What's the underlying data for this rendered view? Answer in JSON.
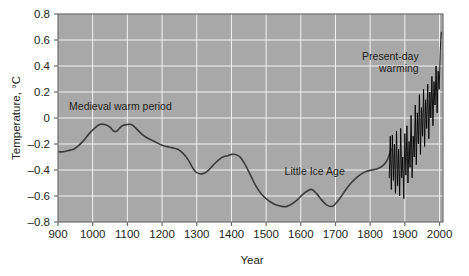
{
  "chart_data": {
    "type": "line",
    "title": "",
    "subtitle": "",
    "xlabel": "Year",
    "ylabel": "Temperature, °C",
    "xlim": [
      900,
      2010
    ],
    "ylim": [
      -0.8,
      0.8
    ],
    "xticks": [
      900,
      1000,
      1100,
      1200,
      1300,
      1400,
      1500,
      1600,
      1700,
      1800,
      1900,
      2000
    ],
    "xtick_labels": [
      "900",
      "1000",
      "1100",
      "1200",
      "1300",
      "1400",
      "1500",
      "1600",
      "1700",
      "1800",
      "1900",
      "2000"
    ],
    "yticks": [
      0.8,
      0.6,
      0.4,
      0.2,
      0,
      -0.2,
      -0.4,
      -0.6,
      -0.8
    ],
    "ytick_labels": [
      "0.8",
      "0.6",
      "0.4",
      "0.2",
      "0",
      "–0.2",
      "–0.4",
      "–0.6",
      "–0.8"
    ],
    "grid": true,
    "grid_color": "#f2f2f2",
    "plot_background": "#a8a8a8",
    "legend": [],
    "legend_position": "none",
    "annotations": [
      {
        "text": "Medieval warm period",
        "x": 1080,
        "y": 0.06,
        "anchor": "middle"
      },
      {
        "text": "Little Ice Age",
        "x": 1640,
        "y": -0.44,
        "anchor": "middle"
      },
      {
        "text": "Present-day warming",
        "lines": [
          "Present-day",
          "warming"
        ],
        "x": 1940,
        "y": 0.45,
        "anchor": "end"
      }
    ],
    "series": [
      {
        "name": "Reconstructed proxy temperature anomaly",
        "color": "#3b3b3b",
        "linewidth": 1.6,
        "x": [
          900,
          915,
          930,
          945,
          960,
          975,
          990,
          1005,
          1020,
          1035,
          1050,
          1060,
          1070,
          1085,
          1100,
          1112,
          1125,
          1140,
          1155,
          1170,
          1185,
          1200,
          1215,
          1230,
          1245,
          1260,
          1275,
          1290,
          1300,
          1315,
          1330,
          1345,
          1360,
          1375,
          1390,
          1400,
          1412,
          1425,
          1440,
          1455,
          1470,
          1485,
          1500,
          1515,
          1530,
          1545,
          1560,
          1575,
          1590,
          1605,
          1620,
          1632,
          1645,
          1660,
          1675,
          1690,
          1700,
          1715,
          1730,
          1745,
          1760,
          1775,
          1790,
          1805,
          1820,
          1835,
          1850,
          1860
        ],
        "y": [
          -0.26,
          -0.26,
          -0.25,
          -0.24,
          -0.21,
          -0.17,
          -0.12,
          -0.08,
          -0.05,
          -0.05,
          -0.07,
          -0.1,
          -0.1,
          -0.06,
          -0.05,
          -0.05,
          -0.08,
          -0.12,
          -0.15,
          -0.17,
          -0.19,
          -0.21,
          -0.22,
          -0.23,
          -0.24,
          -0.27,
          -0.32,
          -0.39,
          -0.42,
          -0.43,
          -0.41,
          -0.37,
          -0.33,
          -0.3,
          -0.29,
          -0.28,
          -0.28,
          -0.3,
          -0.36,
          -0.44,
          -0.52,
          -0.58,
          -0.62,
          -0.65,
          -0.67,
          -0.68,
          -0.68,
          -0.66,
          -0.63,
          -0.59,
          -0.56,
          -0.55,
          -0.58,
          -0.63,
          -0.67,
          -0.68,
          -0.66,
          -0.61,
          -0.55,
          -0.5,
          -0.46,
          -0.43,
          -0.41,
          -0.4,
          -0.39,
          -0.37,
          -0.32,
          -0.24
        ]
      },
      {
        "name": "Instrumental record (present-day warming)",
        "color": "#000000",
        "linewidth": 0.9,
        "x": [
          1855,
          1858,
          1861,
          1864,
          1867,
          1870,
          1873,
          1876,
          1879,
          1882,
          1885,
          1888,
          1891,
          1894,
          1897,
          1900,
          1903,
          1906,
          1909,
          1912,
          1915,
          1918,
          1921,
          1924,
          1927,
          1930,
          1933,
          1936,
          1939,
          1942,
          1945,
          1948,
          1951,
          1954,
          1957,
          1960,
          1963,
          1966,
          1969,
          1972,
          1975,
          1978,
          1981,
          1984,
          1987,
          1990,
          1993,
          1996,
          1999,
          2002,
          2005
        ],
        "y": [
          -0.46,
          -0.14,
          -0.55,
          -0.13,
          -0.48,
          -0.2,
          -0.58,
          -0.1,
          -0.52,
          -0.24,
          -0.6,
          -0.08,
          -0.46,
          -0.3,
          -0.62,
          -0.12,
          -0.44,
          -0.06,
          -0.5,
          -0.18,
          -0.38,
          0.02,
          -0.46,
          -0.14,
          -0.3,
          0.1,
          -0.36,
          0.04,
          -0.2,
          0.18,
          -0.28,
          0.08,
          -0.14,
          0.22,
          -0.22,
          0.14,
          -0.08,
          0.26,
          -0.16,
          0.2,
          0.0,
          0.32,
          -0.06,
          0.28,
          0.1,
          0.4,
          0.04,
          0.36,
          0.22,
          0.52,
          0.66
        ]
      }
    ]
  },
  "axes": {
    "y_title": "Temperature, °C",
    "x_title": "Year"
  }
}
